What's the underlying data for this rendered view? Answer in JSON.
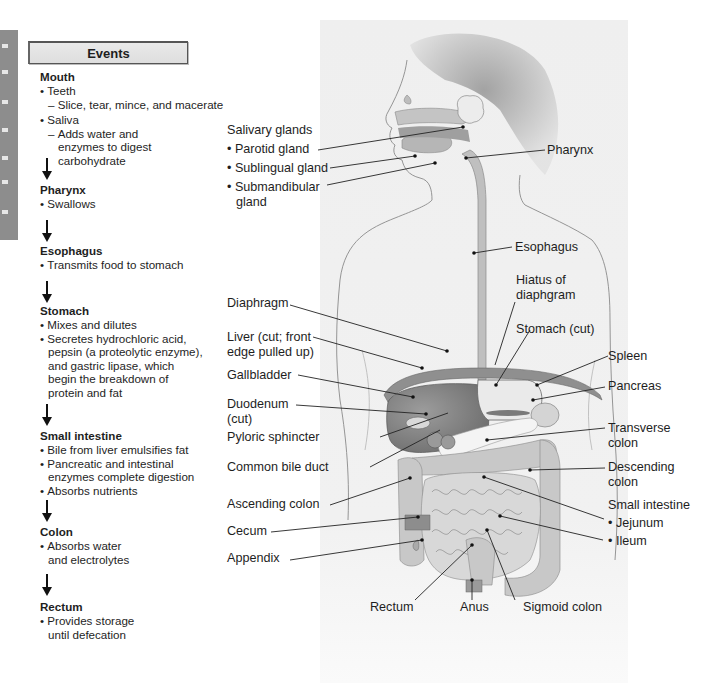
{
  "panel": {
    "title": "Events",
    "stages": [
      {
        "name": "Mouth",
        "items": [
          {
            "text": "Teeth",
            "details": [
              "Slice, tear, mince, and macerate"
            ]
          },
          {
            "text": "Saliva",
            "details": [
              "Adds water and enzymes to digest carbohydrate"
            ]
          }
        ]
      },
      {
        "name": "Pharynx",
        "items": [
          {
            "text": "Swallows"
          }
        ]
      },
      {
        "name": "Esophagus",
        "items": [
          {
            "text": "Transmits food to stomach"
          }
        ]
      },
      {
        "name": "Stomach",
        "items": [
          {
            "text": "Mixes and dilutes"
          },
          {
            "text": "Secretes hydrochloric acid, pepsin (a proteolytic enzyme), and gastric lipase, which begin the breakdown of protein and fat"
          }
        ]
      },
      {
        "name": "Small intestine",
        "items": [
          {
            "text": "Bile from liver emulsifies fat"
          },
          {
            "text": "Pancreatic and intestinal enzymes complete digestion"
          },
          {
            "text": "Absorbs nutrients"
          }
        ]
      },
      {
        "name": "Colon",
        "items": [
          {
            "text": "Absorbs water and electrolytes"
          }
        ]
      },
      {
        "name": "Rectum",
        "items": [
          {
            "text": "Provides storage until defecation"
          }
        ]
      }
    ]
  },
  "labels": {
    "salivary_glands": "Salivary glands",
    "parotid": "Parotid gland",
    "sublingual": "Sublingual gland",
    "submandibular_1": "Submandibular",
    "submandibular_2": "gland",
    "pharynx": "Pharynx",
    "esophagus": "Esophagus",
    "hiatus_1": "Hiatus of",
    "hiatus_2": "diaphgram",
    "diaphragm": "Diaphragm",
    "liver_1": "Liver (cut; front",
    "liver_2": "edge pulled up)",
    "stomach": "Stomach (cut)",
    "gallbladder": "Gallbladder",
    "spleen": "Spleen",
    "pancreas": "Pancreas",
    "duodenum_1": "Duodenum",
    "duodenum_2": "(cut)",
    "pyloric": "Pyloric sphincter",
    "transverse_1": "Transverse",
    "transverse_2": "colon",
    "common_bile": "Common bile duct",
    "descending_1": "Descending",
    "descending_2": "colon",
    "ascending": "Ascending colon",
    "small_intestine": "Small intestine",
    "jejunum": "Jejunum",
    "cecum": "Cecum",
    "ileum": "Ileum",
    "appendix": "Appendix",
    "rectum": "Rectum",
    "anus": "Anus",
    "sigmoid": "Sigmoid colon"
  },
  "colors": {
    "background_panel": "#f1f1f1",
    "organ_dark": "#7a7a7a",
    "organ_mid": "#a9a9a9",
    "organ_light": "#d2d2d2",
    "side_tab": "#8d8d8d",
    "text": "#1e1e1e"
  }
}
